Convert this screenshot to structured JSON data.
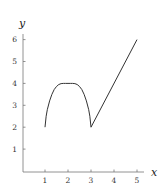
{
  "chart_data": {
    "type": "line",
    "title": "",
    "xlabel": "x",
    "ylabel": "y",
    "xlim": [
      0,
      5.3
    ],
    "ylim": [
      0,
      6.2
    ],
    "grid": false,
    "xticks": [
      1,
      2,
      3,
      4,
      5
    ],
    "yticks": [
      1,
      2,
      3,
      4,
      5,
      6
    ],
    "xtick_labels": [
      "1",
      "2",
      "3",
      "4",
      "5"
    ],
    "ytick_labels": [
      "1",
      "2",
      "3",
      "4",
      "5",
      "6"
    ],
    "series": [
      {
        "name": "arc",
        "x": [
          1.0,
          1.05,
          1.1,
          1.2,
          1.3,
          1.4,
          1.5,
          1.6,
          1.7,
          1.8,
          1.9,
          2.0,
          2.1,
          2.2,
          2.3,
          2.4,
          2.5,
          2.6,
          2.7,
          2.8,
          2.9,
          2.95,
          3.0
        ],
        "y": [
          2.0,
          2.5,
          2.8,
          3.2,
          3.5,
          3.72,
          3.86,
          3.95,
          3.99,
          4.0,
          4.0,
          4.0,
          4.0,
          4.0,
          3.99,
          3.95,
          3.86,
          3.72,
          3.5,
          3.2,
          2.8,
          2.5,
          2.0
        ]
      },
      {
        "name": "line",
        "x": [
          3,
          5
        ],
        "y": [
          2,
          6
        ]
      }
    ]
  }
}
